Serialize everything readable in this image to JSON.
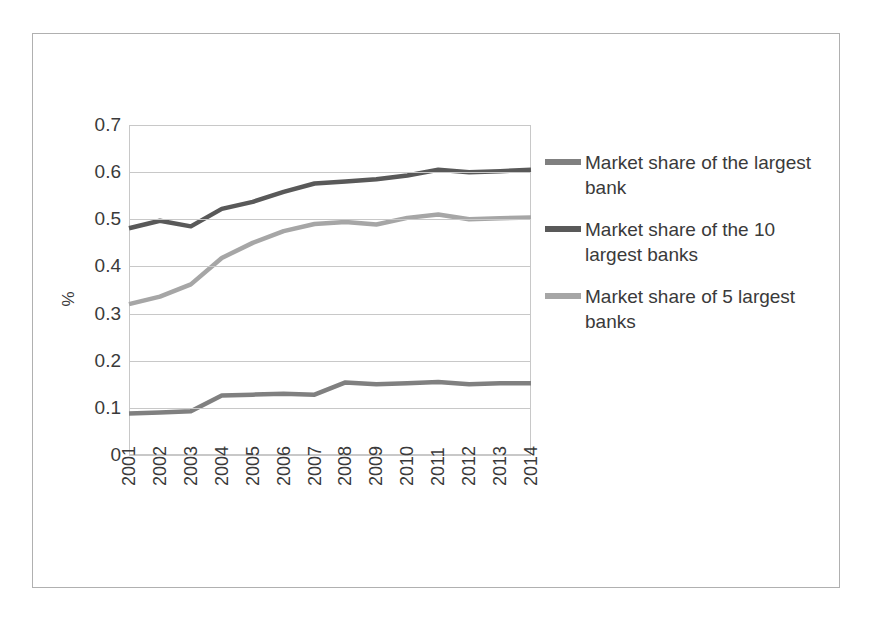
{
  "chart_data": {
    "type": "line",
    "title": "",
    "xlabel": "",
    "ylabel": "%",
    "x": [
      2001,
      2002,
      2003,
      2004,
      2005,
      2006,
      2007,
      2008,
      2009,
      2010,
      2011,
      2012,
      2013,
      2014
    ],
    "categories": [
      "2001",
      "2002",
      "2003",
      "2004",
      "2005",
      "2006",
      "2007",
      "2008",
      "2009",
      "2010",
      "2011",
      "2012",
      "2013",
      "2014"
    ],
    "ylim": [
      0,
      0.7
    ],
    "yticks": [
      0,
      0.1,
      0.2,
      0.3,
      0.4,
      0.5,
      0.6,
      0.7
    ],
    "ytick_labels": [
      "0",
      "0.1",
      "0.2",
      "0.3",
      "0.4",
      "0.5",
      "0.6",
      "0.7"
    ],
    "grid": true,
    "legend_position": "right",
    "series": [
      {
        "name": "Market share of the largest bank",
        "color": "#808080",
        "values": [
          0.088,
          0.09,
          0.093,
          0.126,
          0.128,
          0.13,
          0.128,
          0.154,
          0.15,
          0.152,
          0.155,
          0.15,
          0.152,
          0.152
        ]
      },
      {
        "name": "Market share of the 10 largest banks",
        "color": "#595959",
        "values": [
          0.481,
          0.497,
          0.485,
          0.522,
          0.537,
          0.558,
          0.576,
          0.58,
          0.585,
          0.593,
          0.605,
          0.6,
          0.602,
          0.605
        ]
      },
      {
        "name": "Market share of 5 largest banks",
        "color": "#a6a6a6",
        "values": [
          0.32,
          0.336,
          0.362,
          0.418,
          0.45,
          0.475,
          0.49,
          0.494,
          0.489,
          0.503,
          0.51,
          0.5,
          0.502,
          0.504
        ]
      }
    ]
  },
  "axes": {
    "ylabel": "%",
    "ytick_labels": [
      "0.7",
      "0.6",
      "0.5",
      "0.4",
      "0.3",
      "0.2",
      "0.1",
      "0"
    ],
    "xtick_labels": [
      "2001",
      "2002",
      "2003",
      "2004",
      "2005",
      "2006",
      "2007",
      "2008",
      "2009",
      "2010",
      "2011",
      "2012",
      "2013",
      "2014"
    ]
  },
  "legend": {
    "items": [
      {
        "label": "Market share of the largest bank",
        "color": "#808080"
      },
      {
        "label": "Market share of the 10 largest banks",
        "color": "#595959"
      },
      {
        "label": "Market share of 5 largest banks",
        "color": "#a6a6a6"
      }
    ]
  },
  "colors": {
    "frame": "#b0b0b0",
    "grid": "#c8c8c8",
    "text": "#3a3a3a",
    "background": "#ffffff"
  }
}
